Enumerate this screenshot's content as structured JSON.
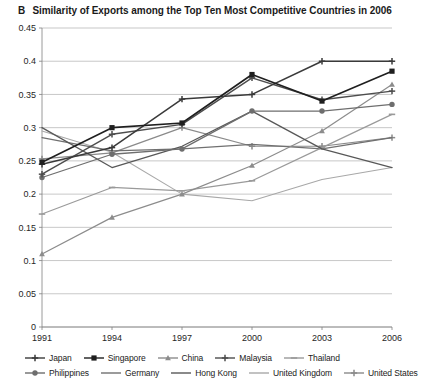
{
  "panel": {
    "letter": "B",
    "title": "Similarity of Exports among the Top Ten Most Competitive Countries in 2006"
  },
  "chart_data": {
    "type": "line",
    "title": "Similarity of Exports among the Top Ten Most Competitive Countries in 2006",
    "xlabel": "",
    "ylabel": "",
    "x": [
      1991,
      1994,
      1997,
      2000,
      2003,
      2006
    ],
    "categories": [
      "1991",
      "1994",
      "1997",
      "2000",
      "2003",
      "2006"
    ],
    "xtick_labels": [
      "1991",
      "1994",
      "1997",
      "2000",
      "2003",
      "2006"
    ],
    "ytick_labels": [
      "0",
      "0.05",
      "0.1",
      "0.15",
      "0.2",
      "0.25",
      "0.3",
      "0.35",
      "0.4",
      "0.45"
    ],
    "ytick_values": [
      0,
      0.05,
      0.1,
      0.15,
      0.2,
      0.25,
      0.3,
      0.35,
      0.4,
      0.45
    ],
    "ylim": [
      0,
      0.45
    ],
    "grid": true,
    "legend_position": "bottom",
    "series": [
      {
        "name": "Japan",
        "marker": "cross",
        "color": "#3a3a3a",
        "width": 1.5,
        "values": [
          0.245,
          0.27,
          0.343,
          0.35,
          0.4,
          0.4
        ]
      },
      {
        "name": "Singapore",
        "marker": "square",
        "color": "#1f1f1f",
        "width": 1.6,
        "values": [
          0.248,
          0.3,
          0.307,
          0.38,
          0.34,
          0.385
        ]
      },
      {
        "name": "China",
        "marker": "triangle",
        "color": "#8c8c8c",
        "width": 1.2,
        "values": [
          0.11,
          0.165,
          0.2,
          0.243,
          0.295,
          0.365
        ]
      },
      {
        "name": "Malaysia",
        "marker": "cross",
        "color": "#4d4d4d",
        "width": 1.4,
        "values": [
          0.23,
          0.29,
          0.305,
          0.375,
          0.342,
          0.355
        ]
      },
      {
        "name": "Thailand",
        "marker": "dash",
        "color": "#9a9a9a",
        "width": 1.2,
        "values": [
          0.17,
          0.21,
          0.205,
          0.22,
          0.27,
          0.32
        ]
      },
      {
        "name": "Philippines",
        "marker": "circle",
        "color": "#6e6e6e",
        "width": 1.3,
        "values": [
          0.225,
          0.26,
          0.268,
          0.325,
          0.325,
          0.335
        ]
      },
      {
        "name": "Germany",
        "marker": "none",
        "color": "#707070",
        "width": 1.2,
        "values": [
          0.285,
          0.265,
          0.268,
          0.275,
          0.268,
          0.285
        ]
      },
      {
        "name": "Hong Kong",
        "marker": "none",
        "color": "#585858",
        "width": 1.3,
        "values": [
          0.3,
          0.24,
          0.272,
          0.325,
          0.268,
          0.24
        ]
      },
      {
        "name": "United Kingdom",
        "marker": "none",
        "color": "#a8a8a8",
        "width": 1.1,
        "values": [
          0.295,
          0.263,
          0.2,
          0.19,
          0.222,
          0.24
        ]
      },
      {
        "name": "United States",
        "marker": "cross",
        "color": "#8a8a8a",
        "width": 1.2,
        "values": [
          0.253,
          0.262,
          0.3,
          0.272,
          0.272,
          0.285
        ]
      }
    ]
  },
  "legend": {
    "rows": [
      [
        {
          "label": "Japan",
          "marker": "cross",
          "color": "#3a3a3a"
        },
        {
          "label": "Singapore",
          "marker": "square",
          "color": "#1f1f1f"
        },
        {
          "label": "China",
          "marker": "triangle",
          "color": "#8c8c8c"
        },
        {
          "label": "Malaysia",
          "marker": "cross",
          "color": "#4d4d4d"
        },
        {
          "label": "Thailand",
          "marker": "dash",
          "color": "#9a9a9a"
        }
      ],
      [
        {
          "label": "Philippines",
          "marker": "circle",
          "color": "#6e6e6e"
        },
        {
          "label": "Germany",
          "marker": "none",
          "color": "#707070"
        },
        {
          "label": "Hong Kong",
          "marker": "none",
          "color": "#585858"
        },
        {
          "label": "United Kingdom",
          "marker": "none",
          "color": "#a8a8a8"
        },
        {
          "label": "United States",
          "marker": "cross",
          "color": "#8a8a8a"
        }
      ]
    ]
  }
}
